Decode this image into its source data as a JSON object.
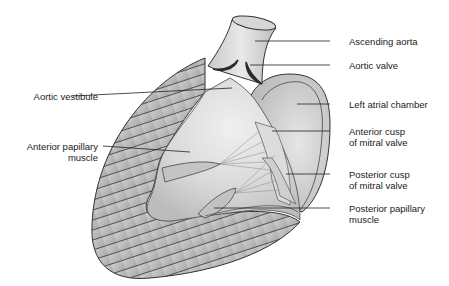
{
  "figure": {
    "type": "anatomical-diagram",
    "labels": {
      "ascending_aorta": "Ascending aorta",
      "aortic_valve": "Aortic valve",
      "aortic_vestibule": "Aortic vestibule",
      "left_atrial_chamber": "Left atrial chamber",
      "anterior_cusp_line1": "Anterior cusp",
      "anterior_cusp_line2": "of mitral valve",
      "anterior_papillary_line1": "Anterior papillary",
      "anterior_papillary_line2": "muscle",
      "posterior_cusp_line1": "Posterior cusp",
      "posterior_cusp_line2": "of mitral valve",
      "posterior_papillary_line1": "Posterior papillary",
      "posterior_papillary_line2": "muscle"
    },
    "colors": {
      "background": "#ffffff",
      "tissue_light": "#e8e8e8",
      "tissue_mid": "#c8c8c8",
      "tissue_dark": "#9a9a9a",
      "outline": "#333333",
      "valve_dark": "#2a2a2a",
      "leader_line": "#222222"
    }
  }
}
